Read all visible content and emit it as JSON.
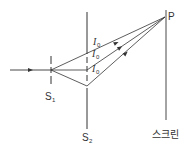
{
  "diagram": {
    "type": "double-slit interference",
    "labels": {
      "slit1": "S",
      "slit1_sub": "1",
      "slit2": "S",
      "slit2_sub": "2",
      "point": "P",
      "screen": "스크린",
      "intensity_main": "I",
      "intensity_sub": "0"
    },
    "intensity_labels_count": 3,
    "colors": {
      "line": "#333333",
      "text": "#333333",
      "background": "#ffffff"
    }
  }
}
